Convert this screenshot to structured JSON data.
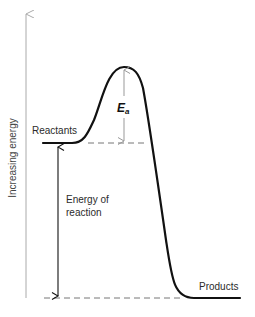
{
  "diagram": {
    "axis": {
      "label": "Increasing energy",
      "direction": "up"
    },
    "curve": {
      "start_label": "Reactants",
      "end_label": "Products",
      "relative_levels": {
        "reactants": 0.66,
        "transition_peak": 1.0,
        "products": 0.0
      }
    },
    "annotations": {
      "activation_energy": {
        "symbol": "E",
        "subscript": "a"
      },
      "energy_of_reaction": {
        "line1": "Energy of",
        "line2": "reaction"
      }
    },
    "colors": {
      "curve": "#111111",
      "axis": "#aaaaaa",
      "dashed_guides": "#777777",
      "ea_arrow": "#999999",
      "reaction_arrow": "#111111"
    }
  }
}
